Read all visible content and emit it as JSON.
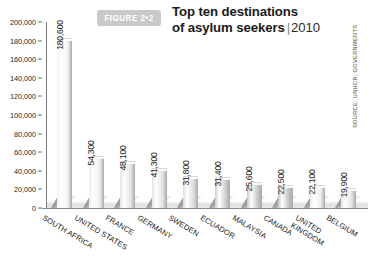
{
  "figure": {
    "badge_label": "FIGURE 2•2",
    "title_line1": "Top ten destinations",
    "title_line2": "of asylum seekers",
    "title_separator": "|",
    "title_year": "2010",
    "source": "SOURCE: UNHCR; GOVERNMENTS"
  },
  "colors": {
    "badge_background": "#c9c9c9",
    "badge_text": "#ffffff",
    "title_text": "#1b1b1b",
    "axis": "#7a7a7a",
    "bar_light": "#f2f2f2",
    "bar_mid": "#d7d7d7",
    "bar_dark": "#b4b4b4",
    "value_text": "#1e1e1e"
  },
  "chart_data": {
    "type": "bar",
    "xlabel": "",
    "ylabel": "",
    "ylim": [
      0,
      200000
    ],
    "ytick_step": 20000,
    "grid": false,
    "legend": "none",
    "categories": [
      "SOUTH AFRICA",
      "UNITED STATES",
      "FRANCE",
      "GERMANY",
      "SWEDEN",
      "ECUADOR",
      "MALAYSIA",
      "CANADA",
      "UNITED KINGDOM",
      "BELGIUM"
    ],
    "values": [
      180600,
      54300,
      48100,
      41300,
      31800,
      31400,
      25600,
      22500,
      22100,
      19900
    ],
    "value_labels": [
      "180,600",
      "54,300",
      "48,100",
      "41,300",
      "31,800",
      "31,400",
      "25,600",
      "22,500",
      "22,100",
      "19,900"
    ],
    "ytick_labels": [
      "200,000",
      "180,000",
      "160,000",
      "140,000",
      "120,000",
      "100,000",
      "80,000",
      "60,000",
      "40,000",
      "20,000",
      "0"
    ],
    "ytick_values": [
      200000,
      180000,
      160000,
      140000,
      120000,
      100000,
      80000,
      60000,
      40000,
      20000,
      0
    ],
    "bar_shades": [
      "#f4f4f4",
      "#ededed",
      "#e6e6e6",
      "#e2e2e2",
      "#dcdcdc",
      "#cdcdcd",
      "#c7c7c7",
      "#c2c2c2",
      "#ededed",
      "#e4e4e4"
    ]
  }
}
